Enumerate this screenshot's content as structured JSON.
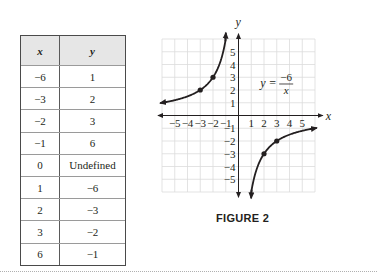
{
  "table": {
    "headers": {
      "x": "x",
      "y": "y"
    },
    "rows": [
      {
        "x": "−6",
        "y": "1"
      },
      {
        "x": "−3",
        "y": "2"
      },
      {
        "x": "−2",
        "y": "3"
      },
      {
        "x": "−1",
        "y": "6"
      },
      {
        "x": "0",
        "y": "Undefined"
      },
      {
        "x": "1",
        "y": "−6"
      },
      {
        "x": "2",
        "y": "−3"
      },
      {
        "x": "3",
        "y": "−2"
      },
      {
        "x": "6",
        "y": "−1"
      }
    ]
  },
  "figure": {
    "caption": "FIGURE 2",
    "equation": {
      "lhs": "y =",
      "numerator": "−6",
      "denominator": "x"
    }
  },
  "chart_data": {
    "type": "line",
    "title": "",
    "equation": "y = -6/x",
    "xlabel": "x",
    "ylabel": "y",
    "xlim": [
      -6,
      6
    ],
    "ylim": [
      -6,
      6
    ],
    "grid": true,
    "x_ticks": [
      "−5",
      "−4",
      "−3",
      "−2",
      "−1",
      "1",
      "2",
      "3",
      "4",
      "5"
    ],
    "y_ticks": [
      "5",
      "4",
      "3",
      "2",
      "1",
      "−1",
      "−2",
      "−3",
      "−4",
      "−5"
    ],
    "series": [
      {
        "name": "branch-left (x<0)",
        "x": [
          -6,
          -3,
          -2,
          -1
        ],
        "y": [
          1,
          2,
          3,
          6
        ],
        "marked_points": [
          [
            -3,
            2
          ],
          [
            -2,
            3
          ]
        ],
        "arrows": [
          "left",
          "up"
        ]
      },
      {
        "name": "branch-right (x>0)",
        "x": [
          1,
          2,
          3,
          6
        ],
        "y": [
          -6,
          -3,
          -2,
          -1
        ],
        "marked_points": [
          [
            2,
            -3
          ],
          [
            3,
            -2
          ]
        ],
        "arrows": [
          "down",
          "right"
        ]
      }
    ],
    "table_points": [
      {
        "x": -6,
        "y": 1
      },
      {
        "x": -3,
        "y": 2
      },
      {
        "x": -2,
        "y": 3
      },
      {
        "x": -1,
        "y": 6
      },
      {
        "x": 0,
        "y": "Undefined"
      },
      {
        "x": 1,
        "y": -6
      },
      {
        "x": 2,
        "y": -3
      },
      {
        "x": 3,
        "y": -2
      },
      {
        "x": 6,
        "y": -1
      }
    ]
  }
}
